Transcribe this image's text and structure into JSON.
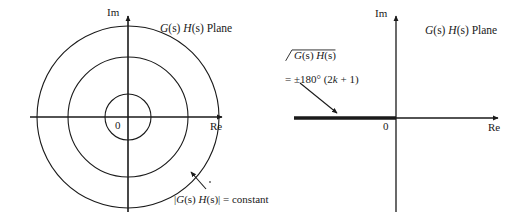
{
  "figure": {
    "left_panel": {
      "plane_label": "G(s) H(s) Plane",
      "im_axis_label": "Im",
      "re_axis_label": "Re",
      "origin_label": "0",
      "annotation": "|G(s) H(s)| = constant",
      "annotation_parts": {
        "bar_open": "|",
        "g": "G",
        "s1": "(s)",
        "space": " ",
        "h": "H",
        "s2": "(s)",
        "bar_close": "|",
        "equals": " = constant"
      },
      "circle_count": 3,
      "circle_radii_px": [
        23,
        60,
        91
      ],
      "center_px": [
        128,
        117
      ]
    },
    "right_panel": {
      "plane_label": "G(s) H(s) Plane",
      "im_axis_label": "Im",
      "re_axis_label": "Re",
      "origin_label": "0",
      "annotation_line1_parts": {
        "g": "G",
        "s1": "(s)",
        "space": " ",
        "h": "H",
        "s2": "(s)"
      },
      "annotation_line2": "= ±180° (2k + 1)",
      "annotation_line2_parts": {
        "eq": "= ±180° (2",
        "k": "k",
        "tail": " + 1)"
      },
      "locus_start_px": 294,
      "locus_end_px": 396,
      "center_px": [
        396,
        118
      ]
    }
  },
  "colors": {
    "ink": "#1a1a1a",
    "background": "#ffffff"
  }
}
